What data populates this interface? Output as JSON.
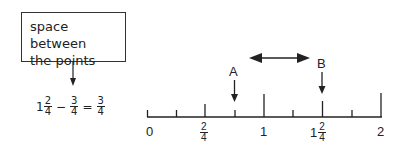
{
  "callout": {
    "text_line1": "space between",
    "text_line2": "the points"
  },
  "equation": {
    "whole": "1",
    "frac1_num": "2",
    "frac1_den": "4",
    "minus": "−",
    "frac2_num": "3",
    "frac2_den": "4",
    "equals": "=",
    "result_num": "3",
    "result_den": "4"
  },
  "number_line": {
    "labels": {
      "zero": "0",
      "two_quarters_num": "2",
      "two_quarters_den": "4",
      "one": "1",
      "one_and_half_whole": "1",
      "one_and_half_num": "2",
      "one_and_half_den": "4",
      "two": "2"
    },
    "point_a": "A",
    "point_b": "B",
    "ticks_per_unit": 4,
    "range": [
      0,
      2
    ],
    "point_a_value": 0.75,
    "point_b_value": 1.5
  }
}
